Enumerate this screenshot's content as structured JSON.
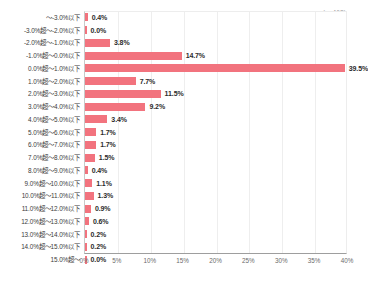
{
  "annotation": {
    "sample_size": "(n=468)"
  },
  "colors": {
    "bar": "#f2737e",
    "axis_line": "#9e9e9e",
    "gridline": "#eeeeee",
    "label_text": "#3b3b3b",
    "value_text": "#2b2b2b",
    "tick_text": "#6b6b6b",
    "background": "#ffffff"
  },
  "axis": {
    "ticks": [
      "0%",
      "5%",
      "10%",
      "15%",
      "20%",
      "25%",
      "30%",
      "35%",
      "40%"
    ],
    "tick_values": [
      0,
      5,
      10,
      15,
      20,
      25,
      30,
      35,
      40
    ]
  },
  "rows": [
    {
      "label": "～-3.0%以下",
      "value": 0.4,
      "value_label": "0.4%"
    },
    {
      "label": "-3.0%超～-2.0%以下",
      "value": 0.0,
      "value_label": "0.0%"
    },
    {
      "label": "-2.0%超～-1.0%以下",
      "value": 3.8,
      "value_label": "3.8%"
    },
    {
      "label": "-1.0%超～0.0%以下",
      "value": 14.7,
      "value_label": "14.7%"
    },
    {
      "label": "0.0%超～1.0%以下",
      "value": 39.5,
      "value_label": "39.5%"
    },
    {
      "label": "1.0%超～2.0%以下",
      "value": 7.7,
      "value_label": "7.7%"
    },
    {
      "label": "2.0%超～3.0%以下",
      "value": 11.5,
      "value_label": "11.5%"
    },
    {
      "label": "3.0%超～4.0%以下",
      "value": 9.2,
      "value_label": "9.2%"
    },
    {
      "label": "4.0%超～5.0%以下",
      "value": 3.4,
      "value_label": "3.4%"
    },
    {
      "label": "5.0%超～6.0%以下",
      "value": 1.7,
      "value_label": "1.7%"
    },
    {
      "label": "6.0%超～7.0%以下",
      "value": 1.7,
      "value_label": "1.7%"
    },
    {
      "label": "7.0%超～8.0%以下",
      "value": 1.5,
      "value_label": "1.5%"
    },
    {
      "label": "8.0%超～9.0%以下",
      "value": 0.4,
      "value_label": "0.4%"
    },
    {
      "label": "9.0%超～10.0%以下",
      "value": 1.1,
      "value_label": "1.1%"
    },
    {
      "label": "10.0%超～11.0%以下",
      "value": 1.3,
      "value_label": "1.3%"
    },
    {
      "label": "11.0%超～12.0%以下",
      "value": 0.9,
      "value_label": "0.9%"
    },
    {
      "label": "12.0%超～13.0%以下",
      "value": 0.6,
      "value_label": "0.6%"
    },
    {
      "label": "13.0%超～14.0%以下",
      "value": 0.2,
      "value_label": "0.2%"
    },
    {
      "label": "14.0%超～15.0%以下",
      "value": 0.2,
      "value_label": "0.2%"
    },
    {
      "label": "15.0%超～",
      "value": 0.0,
      "value_label": "0.0%"
    }
  ],
  "chart_data": {
    "type": "bar",
    "orientation": "horizontal",
    "title": "",
    "subtitle": "",
    "xlabel": "",
    "ylabel": "",
    "xlim": [
      0,
      40
    ],
    "grid": true,
    "legend": false,
    "annotations": [
      "(n=468)"
    ],
    "categories": [
      "～-3.0%以下",
      "-3.0%超～-2.0%以下",
      "-2.0%超～-1.0%以下",
      "-1.0%超～0.0%以下",
      "0.0%超～1.0%以下",
      "1.0%超～2.0%以下",
      "2.0%超～3.0%以下",
      "3.0%超～4.0%以下",
      "4.0%超～5.0%以下",
      "5.0%超～6.0%以下",
      "6.0%超～7.0%以下",
      "7.0%超～8.0%以下",
      "8.0%超～9.0%以下",
      "9.0%超～10.0%以下",
      "10.0%超～11.0%以下",
      "11.0%超～12.0%以下",
      "12.0%超～13.0%以下",
      "13.0%超～14.0%以下",
      "14.0%超～15.0%以下",
      "15.0%超～"
    ],
    "values": [
      0.4,
      0.0,
      3.8,
      14.7,
      39.5,
      7.7,
      11.5,
      9.2,
      3.4,
      1.7,
      1.7,
      1.5,
      0.4,
      1.1,
      1.3,
      0.9,
      0.6,
      0.2,
      0.2,
      0.0
    ],
    "value_labels": [
      "0.4%",
      "0.0%",
      "3.8%",
      "14.7%",
      "39.5%",
      "7.7%",
      "11.5%",
      "9.2%",
      "3.4%",
      "1.7%",
      "1.7%",
      "1.5%",
      "0.4%",
      "1.1%",
      "1.3%",
      "0.9%",
      "0.6%",
      "0.2%",
      "0.2%",
      "0.0%"
    ],
    "xticks": [
      0,
      5,
      10,
      15,
      20,
      25,
      30,
      35,
      40
    ],
    "xticklabels": [
      "0%",
      "5%",
      "10%",
      "15%",
      "20%",
      "25%",
      "30%",
      "35%",
      "40%"
    ],
    "series_color": "#f2737e"
  }
}
